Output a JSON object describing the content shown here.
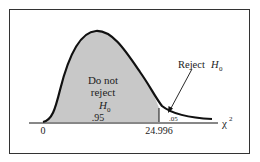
{
  "diagram": {
    "type": "chi-square distribution",
    "region_accept": {
      "line1": "Do not",
      "line2": "reject",
      "h": "H",
      "sub": "0",
      "area": ".95"
    },
    "region_reject": {
      "label": "Reject ",
      "h": "H",
      "sub": "0",
      "area": ".05"
    },
    "axis": {
      "origin": "0",
      "critical_value": "24.996",
      "variable": "χ",
      "sup": "2"
    },
    "colors": {
      "shade": "#c8c8c8",
      "curve": "#111111"
    }
  }
}
